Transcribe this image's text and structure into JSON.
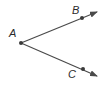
{
  "diagram": {
    "type": "angle",
    "colors": {
      "stroke": "#4a4a4a",
      "point": "#3a3a3a",
      "label": "#2b2b2b"
    },
    "vertex": {
      "label": "A",
      "x": 21,
      "y": 43
    },
    "points": [
      {
        "label": "B",
        "x": 82,
        "y": 18
      },
      {
        "label": "C",
        "x": 83,
        "y": 69
      }
    ],
    "rays": [
      {
        "name": "ray-AB",
        "from": "A",
        "through": "B",
        "end": {
          "x": 97,
          "y": 12
        }
      },
      {
        "name": "ray-AC",
        "from": "A",
        "through": "C",
        "end": {
          "x": 97,
          "y": 76
        }
      }
    ]
  },
  "labels": {
    "a": "A",
    "b": "B",
    "c": "C"
  }
}
